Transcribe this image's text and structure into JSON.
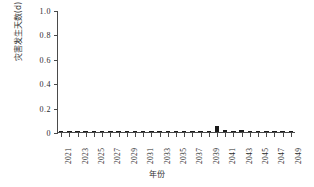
{
  "chart_data": {
    "type": "bar",
    "title": "",
    "xlabel": "年份",
    "ylabel": "灾害发生天数(d)",
    "ylim": [
      0,
      1.0
    ],
    "yticks": [
      0,
      0.2,
      0.4,
      0.6,
      0.8,
      1.0
    ],
    "ytick_labels": [
      "0",
      "0.2",
      "0.4",
      "0.6",
      "0.8",
      "1.0"
    ],
    "grid": false,
    "legend": "none",
    "xlim": [
      2021,
      2049
    ],
    "categories": [
      2021,
      2022,
      2023,
      2024,
      2025,
      2026,
      2027,
      2028,
      2029,
      2030,
      2031,
      2032,
      2033,
      2034,
      2035,
      2036,
      2037,
      2038,
      2039,
      2040,
      2041,
      2042,
      2043,
      2044,
      2045,
      2046,
      2047,
      2048,
      2049
    ],
    "xtick_labels": [
      "2021",
      "2023",
      "2025",
      "2027",
      "2029",
      "2031",
      "2033",
      "2035",
      "2037",
      "2039",
      "2041",
      "2043",
      "2045",
      "2047",
      "2049"
    ],
    "xtick_values": [
      2021,
      2023,
      2025,
      2027,
      2029,
      2031,
      2033,
      2035,
      2037,
      2039,
      2041,
      2043,
      2045,
      2047,
      2049
    ],
    "values": [
      0,
      0,
      0,
      0,
      0,
      0,
      0,
      0,
      0,
      0,
      0,
      0,
      0,
      0,
      0,
      0,
      0,
      0,
      0,
      0.05,
      0.02,
      0.01,
      0.02,
      0,
      0,
      0,
      0,
      0,
      0
    ],
    "series_color": "#1a1a1a",
    "axis_color": "#4a4a4a"
  }
}
